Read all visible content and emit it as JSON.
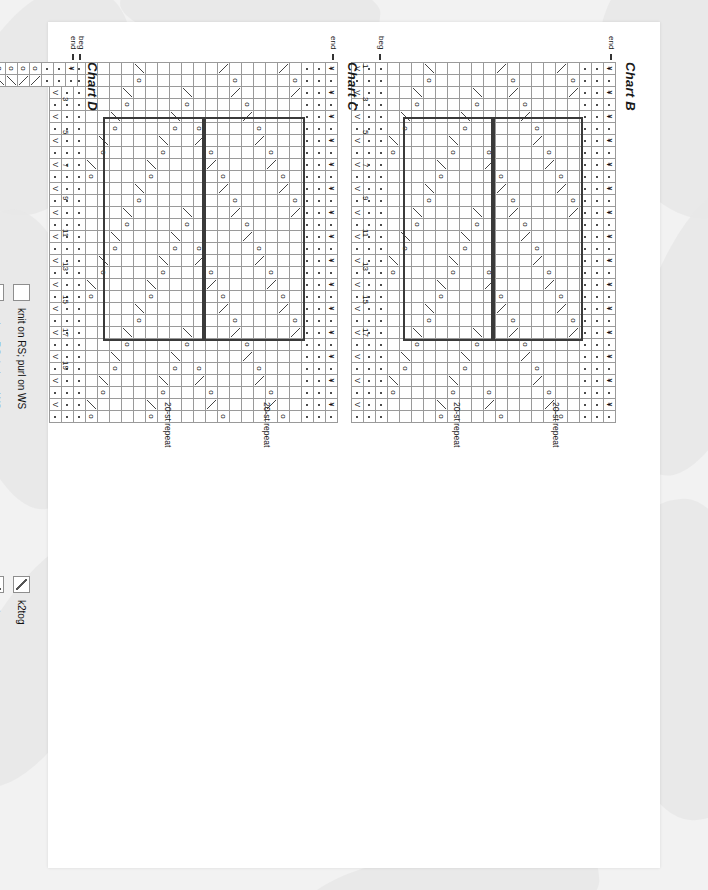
{
  "page": {
    "background_color": "#f2f2f2",
    "paper_color": "#ffffff",
    "orientation": "rotated-90"
  },
  "charts": [
    {
      "id": "chart-b",
      "title": "Chart B",
      "repeat_label": "20-st repeat",
      "begin_label": "beg",
      "end_label": "end",
      "row_numbers": [
        "1",
        "3",
        "5",
        "7",
        "9",
        "11",
        "13",
        "15",
        "17"
      ],
      "columns": 30,
      "rows": 18
    },
    {
      "id": "chart-c",
      "title": "Chart C",
      "repeat_label": "20-st repeat",
      "begin_label": "beg",
      "end_label": "end",
      "row_numbers": [
        "1",
        "3",
        "5",
        "7",
        "9",
        "11",
        "13",
        "15",
        "17",
        "19"
      ],
      "columns": 30,
      "rows": 20
    },
    {
      "id": "chart-d",
      "title": "Chart D",
      "repeat_label": "20-st repeat",
      "begin_label": "beg",
      "end_label": "end",
      "row_numbers": [],
      "columns": 2,
      "rows": 62
    }
  ],
  "legend": {
    "column_one": [
      {
        "symbol": "blank",
        "label": "knit on RS; purl on WS"
      },
      {
        "symbol": "purl",
        "label": "purl on RS; knit on WS"
      },
      {
        "symbol": "sl1-wyf-rs",
        "label": "sl 1 wyf on RS"
      },
      {
        "symbol": "sl1-wyf-ws",
        "label": "sl 1 wyf on WS"
      },
      {
        "symbol": "yo",
        "label": "yo"
      }
    ],
    "column_two": [
      {
        "symbol": "k2tog",
        "label": "k2tog"
      },
      {
        "symbol": "ssk",
        "label": "ssk"
      },
      {
        "symbol": "sk2p",
        "label": "sk2p"
      },
      {
        "symbol": "marker",
        "label": "marker"
      },
      {
        "symbol": "pattern-repeat",
        "label": "pattern repeat"
      }
    ]
  },
  "chart_data": {
    "type": "table",
    "symbol_key": {
      "blank": "knit on RS; purl on WS",
      "purl": "purl on RS; knit on WS",
      "yo": "yo",
      "k2tog": "k2tog",
      "ssk": "ssk",
      "sk2p": "sk2p",
      "sl1-wyf-rs": "sl 1 wyf on RS",
      "sl1-wyf-ws": "sl 1 wyf on WS",
      "marker": "marker",
      "pattern-repeat": "pattern repeat"
    },
    "stitch_repeat": 20,
    "charts": [
      "Chart B",
      "Chart C",
      "Chart D"
    ]
  }
}
